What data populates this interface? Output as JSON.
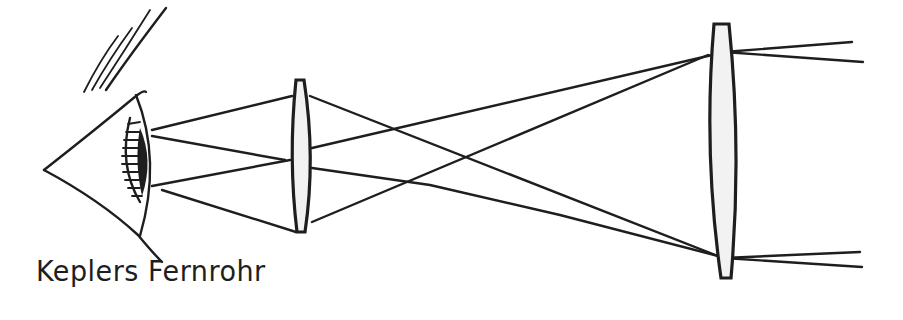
{
  "diagram": {
    "caption": "Keplers Fernrohr",
    "elements": {
      "eye": "eye-icon",
      "eyepiece": "eyepiece-lens",
      "objective": "objective-lens",
      "rays": "light-rays"
    },
    "colors": {
      "ink": "#1e1e1e",
      "background": "#ffffff",
      "lens_fill": "#f2f2f2"
    }
  }
}
